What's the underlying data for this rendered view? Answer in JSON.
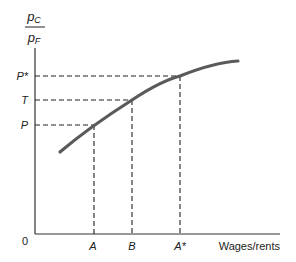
{
  "diagram": {
    "y_axis_label": {
      "numerator": "p",
      "numerator_sub": "C",
      "denominator": "p",
      "denominator_sub": "F"
    },
    "x_axis_label": "Wages/rents",
    "origin_label": "0",
    "y_ticks": [
      {
        "label": "P*",
        "y": 76
      },
      {
        "label": "T",
        "y": 100
      },
      {
        "label": "P",
        "y": 125
      }
    ],
    "x_ticks": [
      {
        "label": "A",
        "x": 94
      },
      {
        "label": "B",
        "x": 132
      },
      {
        "label": "A*",
        "x": 180
      }
    ],
    "curve_color": "#5a5a5a"
  }
}
